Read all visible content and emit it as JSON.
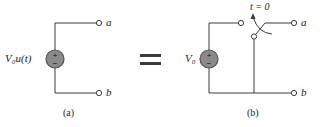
{
  "figure": {
    "panel_a": {
      "caption": "(a)",
      "source_label": "V₀u(t)",
      "terminal_a": "a",
      "terminal_b": "b"
    },
    "equals": "=",
    "panel_b": {
      "caption": "(b)",
      "source_label": "V₀",
      "switch_label": "t = 0",
      "terminal_a": "a",
      "terminal_b": "b"
    },
    "colors": {
      "source_fill": "#8a8a8a",
      "wire": "#3a3a3a"
    }
  }
}
